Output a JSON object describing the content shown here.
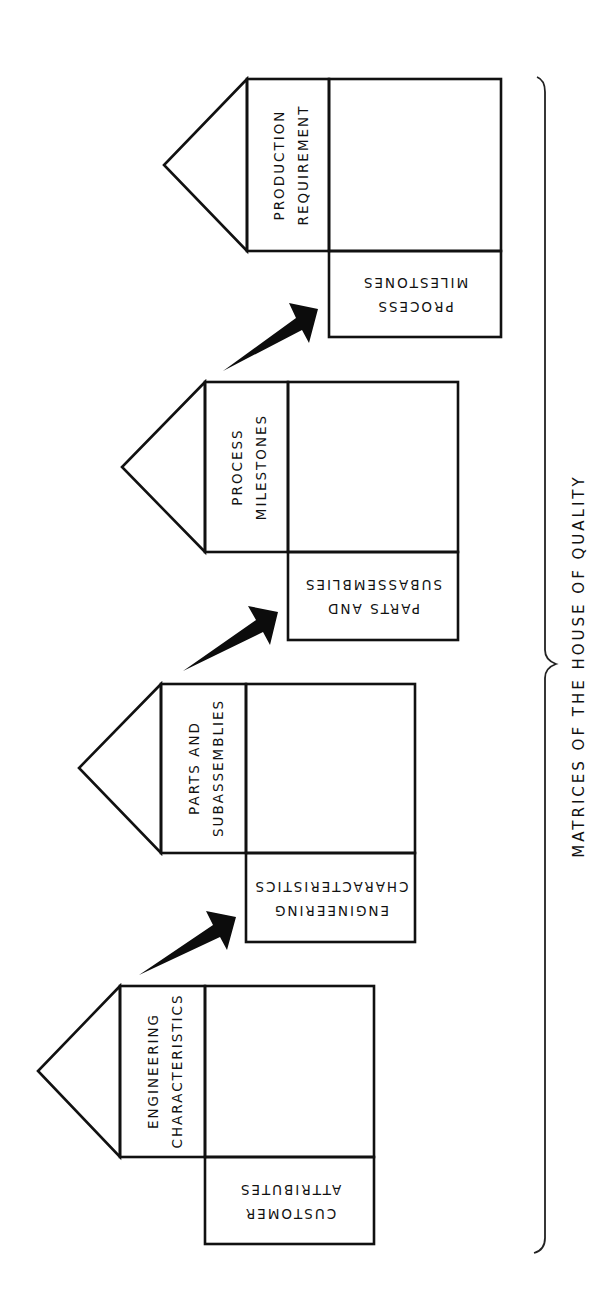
{
  "caption": "MATRICES OF THE HOUSE OF QUALITY",
  "colors": {
    "ink": "#111111",
    "background": "#ffffff"
  },
  "houses": [
    {
      "id": "house-1",
      "roof_top_label": [
        "ENGINEERING",
        "CHARACTERISTICS"
      ],
      "side_label": [
        "CUSTOMER",
        "ATTRIBUTES"
      ]
    },
    {
      "id": "house-2",
      "roof_top_label": [
        "PARTS AND",
        "SUBASSEMBLIES"
      ],
      "side_label": [
        "ENGINEERING",
        "CHARACTERISTICS"
      ]
    },
    {
      "id": "house-3",
      "roof_top_label": [
        "PROCESS",
        "MILESTONES"
      ],
      "side_label": [
        "PARTS AND",
        "SUBASSEMBLIES"
      ]
    },
    {
      "id": "house-4",
      "roof_top_label": [
        "PRODUCTION",
        "REQUIREMENT"
      ],
      "side_label": [
        "PROCESS",
        "MILESTONES"
      ]
    }
  ],
  "arrows": [
    {
      "from": "house-1",
      "to": "house-2",
      "icon": "arrow-right-up-icon"
    },
    {
      "from": "house-2",
      "to": "house-3",
      "icon": "arrow-right-up-icon"
    },
    {
      "from": "house-3",
      "to": "house-4",
      "icon": "arrow-right-up-icon"
    }
  ]
}
